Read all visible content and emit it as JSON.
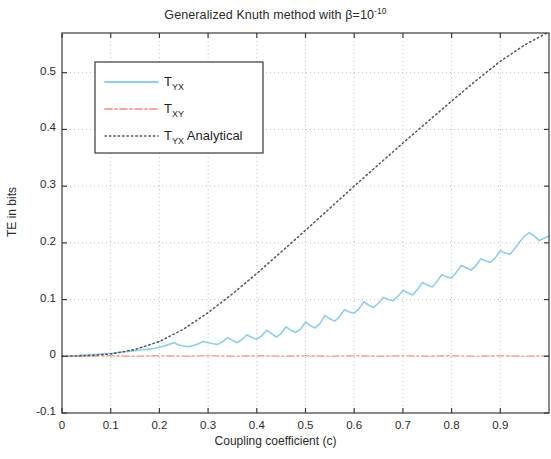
{
  "chart_data": {
    "type": "line",
    "title": "Generalized Knuth method with β=10",
    "title_exponent": "-10",
    "xlabel": "Coupling coefficient (c)",
    "ylabel": "TE in bits",
    "xlim": [
      0,
      1.0
    ],
    "ylim": [
      -0.1,
      0.57
    ],
    "xticks": [
      0,
      0.1,
      0.2,
      0.3,
      0.4,
      0.5,
      0.6,
      0.7,
      0.8,
      0.9
    ],
    "xtick_labels": [
      "0",
      "0.1",
      "0.2",
      "0.3",
      "0.4",
      "0.5",
      "0.6",
      "0.7",
      "0.8",
      "0.9"
    ],
    "yticks": [
      -0.1,
      0,
      0.1,
      0.2,
      0.3,
      0.4,
      0.5
    ],
    "ytick_labels": [
      "-0.1",
      "0",
      "0.1",
      "0.2",
      "0.3",
      "0.4",
      "0.5"
    ],
    "grid": true,
    "grid_style": "dotted",
    "legend_position": "upper left",
    "legend": [
      {
        "label_main": "T",
        "label_sub": "YX",
        "label_extra": "",
        "style": "solid",
        "color": "#8fcfe8"
      },
      {
        "label_main": "T",
        "label_sub": "XY",
        "label_extra": "",
        "style": "dashdot",
        "color": "#f4a8a0"
      },
      {
        "label_main": "T",
        "label_sub": "YX",
        "label_extra": " Analytical",
        "style": "dotted",
        "color": "#555555"
      }
    ],
    "series": [
      {
        "name": "T_YX",
        "color": "#8fcfe8",
        "style": "solid",
        "x": [
          0.0,
          0.01,
          0.02,
          0.03,
          0.04,
          0.05,
          0.06,
          0.07,
          0.08,
          0.09,
          0.1,
          0.11,
          0.12,
          0.13,
          0.14,
          0.15,
          0.16,
          0.17,
          0.18,
          0.19,
          0.2,
          0.21,
          0.22,
          0.23,
          0.24,
          0.25,
          0.26,
          0.27,
          0.28,
          0.29,
          0.3,
          0.31,
          0.32,
          0.33,
          0.34,
          0.35,
          0.36,
          0.37,
          0.38,
          0.39,
          0.4,
          0.41,
          0.42,
          0.43,
          0.44,
          0.45,
          0.46,
          0.47,
          0.48,
          0.49,
          0.5,
          0.51,
          0.52,
          0.53,
          0.54,
          0.55,
          0.56,
          0.57,
          0.58,
          0.59,
          0.6,
          0.61,
          0.62,
          0.63,
          0.64,
          0.65,
          0.66,
          0.67,
          0.68,
          0.69,
          0.7,
          0.71,
          0.72,
          0.73,
          0.74,
          0.75,
          0.76,
          0.77,
          0.78,
          0.79,
          0.8,
          0.81,
          0.82,
          0.83,
          0.84,
          0.85,
          0.86,
          0.87,
          0.88,
          0.89,
          0.9,
          0.91,
          0.92,
          0.93,
          0.94,
          0.95,
          0.96,
          0.97,
          0.98,
          0.99,
          1.0
        ],
        "y": [
          0.0,
          0.0,
          0.001,
          0.001,
          0.002,
          0.002,
          0.003,
          0.003,
          0.004,
          0.005,
          0.005,
          0.006,
          0.007,
          0.008,
          0.009,
          0.01,
          0.011,
          0.012,
          0.013,
          0.014,
          0.016,
          0.018,
          0.021,
          0.024,
          0.02,
          0.018,
          0.017,
          0.019,
          0.022,
          0.026,
          0.024,
          0.022,
          0.021,
          0.026,
          0.033,
          0.028,
          0.024,
          0.03,
          0.038,
          0.033,
          0.03,
          0.036,
          0.046,
          0.04,
          0.034,
          0.04,
          0.052,
          0.046,
          0.042,
          0.048,
          0.06,
          0.054,
          0.05,
          0.058,
          0.072,
          0.066,
          0.062,
          0.07,
          0.082,
          0.078,
          0.076,
          0.084,
          0.096,
          0.09,
          0.086,
          0.094,
          0.104,
          0.1,
          0.098,
          0.106,
          0.116,
          0.112,
          0.108,
          0.118,
          0.13,
          0.126,
          0.122,
          0.132,
          0.144,
          0.14,
          0.138,
          0.148,
          0.16,
          0.156,
          0.152,
          0.16,
          0.172,
          0.168,
          0.166,
          0.174,
          0.186,
          0.182,
          0.18,
          0.19,
          0.202,
          0.212,
          0.218,
          0.212,
          0.204,
          0.208,
          0.212
        ]
      },
      {
        "name": "T_XY",
        "color": "#f4a8a0",
        "style": "dashdot",
        "x": [
          0.0,
          0.05,
          0.1,
          0.15,
          0.2,
          0.25,
          0.3,
          0.35,
          0.4,
          0.45,
          0.5,
          0.55,
          0.6,
          0.65,
          0.7,
          0.75,
          0.8,
          0.85,
          0.9,
          0.95,
          1.0
        ],
        "y": [
          0.0,
          0.0,
          0.001,
          0.0,
          0.001,
          0.0,
          0.001,
          0.0,
          0.001,
          0.0,
          0.001,
          0.0,
          0.001,
          0.0,
          0.001,
          0.0,
          0.001,
          0.0,
          0.001,
          0.0,
          0.001
        ]
      },
      {
        "name": "T_YX Analytical",
        "color": "#555555",
        "style": "dotted",
        "x": [
          0.0,
          0.05,
          0.1,
          0.15,
          0.2,
          0.25,
          0.3,
          0.35,
          0.4,
          0.45,
          0.5,
          0.55,
          0.6,
          0.65,
          0.7,
          0.75,
          0.8,
          0.85,
          0.9,
          0.95,
          1.0
        ],
        "y": [
          0.0,
          0.001,
          0.004,
          0.012,
          0.026,
          0.048,
          0.077,
          0.11,
          0.146,
          0.184,
          0.222,
          0.261,
          0.3,
          0.338,
          0.376,
          0.413,
          0.45,
          0.486,
          0.52,
          0.549,
          0.572
        ]
      }
    ]
  }
}
